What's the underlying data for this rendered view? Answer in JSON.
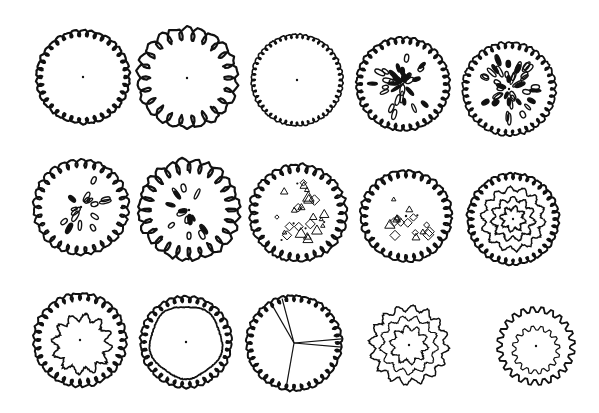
{
  "colors": {
    "ink": "#111111",
    "background": "#ffffff"
  },
  "symbols": [
    {
      "id": 1,
      "row": 1,
      "col": 1,
      "cx": 83,
      "cy": 77,
      "r": 45,
      "style": "scallop-small",
      "label": "Scalloped outline with center dot"
    },
    {
      "id": 2,
      "row": 1,
      "col": 2,
      "cx": 187,
      "cy": 78,
      "r": 50,
      "style": "scallop-large",
      "label": "Large loop outline with center dot"
    },
    {
      "id": 3,
      "row": 1,
      "col": 3,
      "cx": 297,
      "cy": 80,
      "r": 45,
      "style": "scallop-fine",
      "label": "Fine scalloped outline with center dot"
    },
    {
      "id": 4,
      "row": 1,
      "col": 4,
      "cx": 403,
      "cy": 84,
      "r": 46,
      "style": "scallop-leaves",
      "label": "Scalloped outline with leaf marks"
    },
    {
      "id": 5,
      "row": 1,
      "col": 5,
      "cx": 509,
      "cy": 89,
      "r": 46,
      "style": "scallop-leaves-dense",
      "label": "Scalloped outline with dense leaf marks"
    },
    {
      "id": 6,
      "row": 2,
      "col": 1,
      "cx": 81,
      "cy": 207,
      "r": 47,
      "style": "scallop-leaves-sparse",
      "label": "Scalloped outline with sparse leaves"
    },
    {
      "id": 7,
      "row": 2,
      "col": 2,
      "cx": 189,
      "cy": 210,
      "r": 50,
      "style": "scallop-large-leaves",
      "label": "Large loops with leaf marks"
    },
    {
      "id": 8,
      "row": 2,
      "col": 3,
      "cx": 298,
      "cy": 213,
      "r": 48,
      "style": "scallop-shapes",
      "label": "Scalloped outline with geometric shapes"
    },
    {
      "id": 9,
      "row": 2,
      "col": 4,
      "cx": 406,
      "cy": 216,
      "r": 46,
      "style": "scallop-shapes-sparse",
      "label": "Scalloped outline with sparse shapes"
    },
    {
      "id": 10,
      "row": 2,
      "col": 5,
      "cx": 513,
      "cy": 219,
      "r": 46,
      "style": "scallop-rings",
      "label": "Concentric wavy rings"
    },
    {
      "id": 11,
      "row": 3,
      "col": 1,
      "cx": 80,
      "cy": 340,
      "r": 47,
      "style": "scallop-inner-wavy",
      "label": "Scalloped outline with inner wavy lines"
    },
    {
      "id": 12,
      "row": 3,
      "col": 2,
      "cx": 186,
      "cy": 342,
      "r": 46,
      "style": "scallop-inner-ring",
      "label": "Scalloped outline with inner ring"
    },
    {
      "id": 13,
      "row": 3,
      "col": 3,
      "cx": 294,
      "cy": 343,
      "r": 48,
      "style": "scallop-radial",
      "label": "Scalloped outline with radial branch lines"
    },
    {
      "id": 14,
      "row": 3,
      "col": 4,
      "cx": 409,
      "cy": 345,
      "r": 41,
      "style": "cloud-layers",
      "label": "Layered cloud outline"
    },
    {
      "id": 15,
      "row": 3,
      "col": 5,
      "cx": 536,
      "cy": 346,
      "r": 40,
      "style": "crenellated",
      "label": "Crenellated outline with inner marks"
    }
  ]
}
